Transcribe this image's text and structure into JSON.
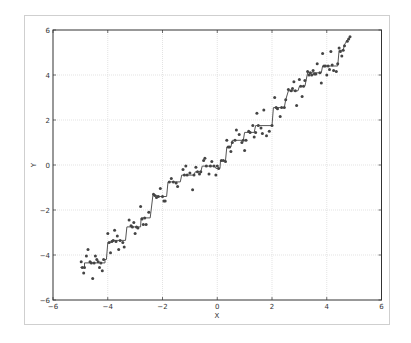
{
  "chart_data": {
    "type": "scatter",
    "title": "",
    "xlabel": "X",
    "ylabel": "Y",
    "xlim": [
      -6,
      6
    ],
    "ylim": [
      -6,
      6
    ],
    "xticks": [
      -6,
      -4,
      -2,
      0,
      2,
      4,
      6
    ],
    "yticks": [
      -6,
      -4,
      -2,
      0,
      2,
      4,
      6
    ],
    "grid": true,
    "legend": null,
    "series": [
      {
        "name": "data",
        "kind": "scatter",
        "color": "#444444",
        "points": [
          [
            -4.97,
            -4.3
          ],
          [
            -4.93,
            -4.55
          ],
          [
            -4.88,
            -4.8
          ],
          [
            -4.85,
            -4.55
          ],
          [
            -4.78,
            -4.05
          ],
          [
            -4.72,
            -3.75
          ],
          [
            -4.65,
            -4.3
          ],
          [
            -4.6,
            -4.35
          ],
          [
            -4.55,
            -5.05
          ],
          [
            -4.5,
            -4.35
          ],
          [
            -4.45,
            -4.05
          ],
          [
            -4.4,
            -4.2
          ],
          [
            -4.35,
            -4.3
          ],
          [
            -4.3,
            -4.55
          ],
          [
            -4.25,
            -4.35
          ],
          [
            -4.2,
            -4.7
          ],
          [
            -4.15,
            -4.2
          ],
          [
            -4.0,
            -3.05
          ],
          [
            -3.95,
            -3.45
          ],
          [
            -3.9,
            -3.9
          ],
          [
            -3.85,
            -3.4
          ],
          [
            -3.8,
            -3.35
          ],
          [
            -3.75,
            -2.9
          ],
          [
            -3.7,
            -3.4
          ],
          [
            -3.65,
            -3.15
          ],
          [
            -3.6,
            -3.75
          ],
          [
            -3.55,
            -3.35
          ],
          [
            -3.45,
            -3.45
          ],
          [
            -3.4,
            -3.65
          ],
          [
            -3.22,
            -2.45
          ],
          [
            -3.15,
            -2.7
          ],
          [
            -3.1,
            -2.75
          ],
          [
            -3.05,
            -2.55
          ],
          [
            -3.0,
            -3.05
          ],
          [
            -2.95,
            -2.75
          ],
          [
            -2.9,
            -2.8
          ],
          [
            -2.8,
            -1.85
          ],
          [
            -2.75,
            -2.4
          ],
          [
            -2.7,
            -2.65
          ],
          [
            -2.65,
            -2.35
          ],
          [
            -2.6,
            -2.65
          ],
          [
            -2.5,
            -2.1
          ],
          [
            -2.33,
            -1.3
          ],
          [
            -2.28,
            -1.35
          ],
          [
            -2.22,
            -1.45
          ],
          [
            -2.15,
            -1.4
          ],
          [
            -2.08,
            -1.05
          ],
          [
            -2.0,
            -1.4
          ],
          [
            -1.95,
            -1.6
          ],
          [
            -1.9,
            -1.6
          ],
          [
            -1.75,
            -0.75
          ],
          [
            -1.68,
            -0.6
          ],
          [
            -1.6,
            -0.75
          ],
          [
            -1.5,
            -0.8
          ],
          [
            -1.45,
            -0.95
          ],
          [
            -1.25,
            -0.2
          ],
          [
            -1.2,
            -0.45
          ],
          [
            -1.15,
            -0.05
          ],
          [
            -1.1,
            -0.45
          ],
          [
            -1.0,
            -0.35
          ],
          [
            -0.9,
            -1.1
          ],
          [
            -0.85,
            -0.45
          ],
          [
            -0.78,
            -0.1
          ],
          [
            -0.72,
            -0.3
          ],
          [
            -0.65,
            -0.4
          ],
          [
            -0.6,
            -0.3
          ],
          [
            -0.5,
            0.2
          ],
          [
            -0.45,
            0.3
          ],
          [
            -0.4,
            -0.05
          ],
          [
            -0.3,
            -0.4
          ],
          [
            -0.25,
            -0.05
          ],
          [
            -0.2,
            0.15
          ],
          [
            -0.12,
            -0.05
          ],
          [
            -0.05,
            -0.45
          ],
          [
            0.0,
            -0.05
          ],
          [
            0.05,
            -0.15
          ],
          [
            0.15,
            0.2
          ],
          [
            0.22,
            0.2
          ],
          [
            0.3,
            0.15
          ],
          [
            0.35,
            1.1
          ],
          [
            0.4,
            0.8
          ],
          [
            0.45,
            0.8
          ],
          [
            0.5,
            0.6
          ],
          [
            0.55,
            1.0
          ],
          [
            0.65,
            1.1
          ],
          [
            0.7,
            1.55
          ],
          [
            0.8,
            1.35
          ],
          [
            0.9,
            1.0
          ],
          [
            0.95,
            1.1
          ],
          [
            1.0,
            0.65
          ],
          [
            1.05,
            1.1
          ],
          [
            1.15,
            1.5
          ],
          [
            1.2,
            1.45
          ],
          [
            1.3,
            1.75
          ],
          [
            1.35,
            1.25
          ],
          [
            1.4,
            1.45
          ],
          [
            1.45,
            2.3
          ],
          [
            1.5,
            1.75
          ],
          [
            1.6,
            1.65
          ],
          [
            1.65,
            1.4
          ],
          [
            1.7,
            2.45
          ],
          [
            1.8,
            1.3
          ],
          [
            1.9,
            1.5
          ],
          [
            2.0,
            1.75
          ],
          [
            2.1,
            3.0
          ],
          [
            2.15,
            2.55
          ],
          [
            2.2,
            2.5
          ],
          [
            2.3,
            2.15
          ],
          [
            2.35,
            2.55
          ],
          [
            2.45,
            2.55
          ],
          [
            2.5,
            2.9
          ],
          [
            2.6,
            3.35
          ],
          [
            2.7,
            3.3
          ],
          [
            2.75,
            3.4
          ],
          [
            2.8,
            3.7
          ],
          [
            2.85,
            3.3
          ],
          [
            2.9,
            2.65
          ],
          [
            3.0,
            3.8
          ],
          [
            3.05,
            3.5
          ],
          [
            3.1,
            3.05
          ],
          [
            3.15,
            3.5
          ],
          [
            3.2,
            3.75
          ],
          [
            3.3,
            4.15
          ],
          [
            3.35,
            4.0
          ],
          [
            3.4,
            4.1
          ],
          [
            3.45,
            4.0
          ],
          [
            3.5,
            4.2
          ],
          [
            3.55,
            4.05
          ],
          [
            3.6,
            4.05
          ],
          [
            3.65,
            4.5
          ],
          [
            3.75,
            4.1
          ],
          [
            3.8,
            3.65
          ],
          [
            3.85,
            4.95
          ],
          [
            3.9,
            4.4
          ],
          [
            3.95,
            4.4
          ],
          [
            4.0,
            4.0
          ],
          [
            4.05,
            4.4
          ],
          [
            4.1,
            4.25
          ],
          [
            4.15,
            5.05
          ],
          [
            4.2,
            4.45
          ],
          [
            4.25,
            4.2
          ],
          [
            4.35,
            4.15
          ],
          [
            4.4,
            4.5
          ],
          [
            4.45,
            5.2
          ],
          [
            4.5,
            5.05
          ],
          [
            4.55,
            4.85
          ],
          [
            4.6,
            5.1
          ],
          [
            4.65,
            5.3
          ],
          [
            4.75,
            5.5
          ],
          [
            4.8,
            5.6
          ],
          [
            4.85,
            5.7
          ]
        ]
      },
      {
        "name": "step fit",
        "kind": "step-line",
        "color": "#555555",
        "points": [
          [
            -5.0,
            -4.55
          ],
          [
            -4.85,
            -4.55
          ],
          [
            -4.85,
            -4.35
          ],
          [
            -4.1,
            -4.35
          ],
          [
            -4.1,
            -4.2
          ],
          [
            -4.05,
            -4.2
          ],
          [
            -4.0,
            -3.45
          ],
          [
            -3.9,
            -3.45
          ],
          [
            -3.85,
            -3.35
          ],
          [
            -3.35,
            -3.35
          ],
          [
            -3.3,
            -2.75
          ],
          [
            -2.8,
            -2.75
          ],
          [
            -2.78,
            -2.35
          ],
          [
            -2.45,
            -2.35
          ],
          [
            -2.35,
            -1.35
          ],
          [
            -2.2,
            -1.35
          ],
          [
            -2.15,
            -1.4
          ],
          [
            -1.85,
            -1.4
          ],
          [
            -1.8,
            -0.75
          ],
          [
            -1.35,
            -0.75
          ],
          [
            -1.3,
            -0.45
          ],
          [
            -0.85,
            -0.45
          ],
          [
            -0.8,
            -0.3
          ],
          [
            -0.6,
            -0.3
          ],
          [
            -0.55,
            -0.05
          ],
          [
            -0.1,
            -0.05
          ],
          [
            -0.05,
            -0.15
          ],
          [
            0.1,
            -0.15
          ],
          [
            0.12,
            0.2
          ],
          [
            0.3,
            0.2
          ],
          [
            0.35,
            0.8
          ],
          [
            0.5,
            0.8
          ],
          [
            0.55,
            1.1
          ],
          [
            0.95,
            1.1
          ],
          [
            1.0,
            1.45
          ],
          [
            1.35,
            1.45
          ],
          [
            1.4,
            1.75
          ],
          [
            2.0,
            1.75
          ],
          [
            2.05,
            2.55
          ],
          [
            2.45,
            2.55
          ],
          [
            2.5,
            2.9
          ],
          [
            2.6,
            3.3
          ],
          [
            2.95,
            3.3
          ],
          [
            3.0,
            3.5
          ],
          [
            3.2,
            3.5
          ],
          [
            3.3,
            4.1
          ],
          [
            3.8,
            4.1
          ],
          [
            3.85,
            4.4
          ],
          [
            4.4,
            4.4
          ],
          [
            4.45,
            5.1
          ],
          [
            4.6,
            5.1
          ],
          [
            4.65,
            5.35
          ],
          [
            4.75,
            5.55
          ],
          [
            4.85,
            5.7
          ]
        ]
      }
    ]
  },
  "colors": {
    "grid": "#dcdcdc",
    "axes": "#333333",
    "frame": "#cfcfcf"
  }
}
